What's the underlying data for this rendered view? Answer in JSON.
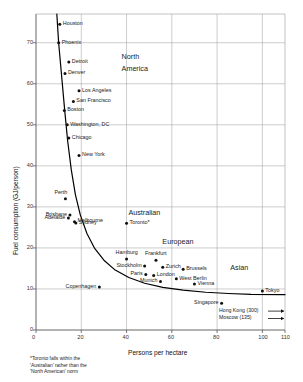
{
  "chart_data": {
    "type": "scatter",
    "title": "",
    "xlabel": "Persons per hectare",
    "ylabel": "Fuel consumption (GJ/person)",
    "xlim": [
      0,
      110
    ],
    "ylim": [
      0,
      77
    ],
    "xticks": [
      0,
      20,
      40,
      60,
      80,
      100,
      110
    ],
    "xtick_labels": [
      "0",
      "20",
      "40",
      "60",
      "80",
      "100",
      "110"
    ],
    "yticks": [
      0,
      10,
      20,
      30,
      40,
      50,
      60,
      70
    ],
    "ytick_labels": [
      "0",
      "10",
      "20",
      "30",
      "40",
      "50",
      "60",
      "70"
    ],
    "grid": true,
    "legend_position": "none",
    "points": [
      {
        "name": "Houston",
        "x": 10.5,
        "y": 74.5,
        "label_side": "right"
      },
      {
        "name": "Phoenix",
        "x": 10.0,
        "y": 70.0,
        "label_side": "right"
      },
      {
        "name": "Detroit",
        "x": 14.5,
        "y": 65.3,
        "label_side": "right"
      },
      {
        "name": "Denver",
        "x": 12.8,
        "y": 62.5,
        "label_side": "right"
      },
      {
        "name": "Los Angeles",
        "x": 19.0,
        "y": 58.3,
        "label_side": "right"
      },
      {
        "name": "San Francisco",
        "x": 16.5,
        "y": 55.7,
        "label_side": "right"
      },
      {
        "name": "Boston",
        "x": 12.5,
        "y": 53.5,
        "label_side": "right"
      },
      {
        "name": "Washington, DC",
        "x": 13.8,
        "y": 50.0,
        "label_side": "right"
      },
      {
        "name": "Chicago",
        "x": 14.5,
        "y": 46.8,
        "label_side": "right"
      },
      {
        "name": "New York",
        "x": 19.0,
        "y": 42.5,
        "label_side": "right"
      },
      {
        "name": "Perth",
        "x": 13.0,
        "y": 32.0,
        "label_side": "above"
      },
      {
        "name": "Brisbane",
        "x": 15.0,
        "y": 28.0,
        "label_side": "left"
      },
      {
        "name": "Adelaide",
        "x": 14.3,
        "y": 27.3,
        "label_side": "left"
      },
      {
        "name": "Melbourne",
        "x": 17.0,
        "y": 26.4,
        "label_side": "right"
      },
      {
        "name": "Sydney",
        "x": 17.6,
        "y": 26.1,
        "label_side": "right"
      },
      {
        "name": "Toronto*",
        "x": 40.0,
        "y": 26.0,
        "label_side": "right"
      },
      {
        "name": "Hamburg",
        "x": 40.0,
        "y": 17.3,
        "label_side": "above"
      },
      {
        "name": "Frankfurt",
        "x": 53.0,
        "y": 17.0,
        "label_side": "above"
      },
      {
        "name": "Stockholm",
        "x": 48.0,
        "y": 15.6,
        "label_side": "left"
      },
      {
        "name": "Zurich",
        "x": 56.0,
        "y": 15.3,
        "label_side": "right"
      },
      {
        "name": "Brussels",
        "x": 65.0,
        "y": 14.8,
        "label_side": "right"
      },
      {
        "name": "Paris",
        "x": 48.5,
        "y": 13.5,
        "label_side": "left"
      },
      {
        "name": "London",
        "x": 52.0,
        "y": 13.3,
        "label_side": "right"
      },
      {
        "name": "West Berlin",
        "x": 62.0,
        "y": 12.5,
        "label_side": "right"
      },
      {
        "name": "Munich",
        "x": 55.0,
        "y": 11.8,
        "label_side": "left"
      },
      {
        "name": "Vienna",
        "x": 70.0,
        "y": 11.2,
        "label_side": "right"
      },
      {
        "name": "Copenhagen",
        "x": 28.0,
        "y": 10.5,
        "label_side": "left"
      },
      {
        "name": "Tokyo",
        "x": 100.0,
        "y": 9.5,
        "label_side": "right"
      },
      {
        "name": "Singapore",
        "x": 82.0,
        "y": 6.5,
        "label_side": "left"
      }
    ],
    "group_labels": [
      {
        "text": "North",
        "x": 44,
        "y": 66.5
      },
      {
        "text": "America",
        "x": 44,
        "y": 63.5
      },
      {
        "text": "Australian",
        "x": 47,
        "y": 28.5
      },
      {
        "text": "European",
        "x": 62,
        "y": 21.5
      },
      {
        "text": "Asian",
        "x": 92,
        "y": 15.0
      }
    ],
    "offscale_annotations": [
      {
        "text": "Hong Kong (300)",
        "value": 300,
        "y": 4.6
      },
      {
        "text": "Moscow (135)",
        "value": 135,
        "y": 2.8
      }
    ],
    "trend_curve": {
      "description": "hyperbolic decay fit",
      "points": [
        [
          9.2,
          77.0
        ],
        [
          10.0,
          70.0
        ],
        [
          11.3,
          62.0
        ],
        [
          12.6,
          54.0
        ],
        [
          14.0,
          46.0
        ],
        [
          15.6,
          39.0
        ],
        [
          17.4,
          33.0
        ],
        [
          19.6,
          28.0
        ],
        [
          22.5,
          23.5
        ],
        [
          26.0,
          19.8
        ],
        [
          30.0,
          17.0
        ],
        [
          35.0,
          14.6
        ],
        [
          41.0,
          12.8
        ],
        [
          48.0,
          11.4
        ],
        [
          56.0,
          10.4
        ],
        [
          65.0,
          9.7
        ],
        [
          75.0,
          9.2
        ],
        [
          85.0,
          8.9
        ],
        [
          95.0,
          8.7
        ],
        [
          110.0,
          8.6
        ]
      ]
    },
    "footnote": "*Toronto falls within the 'Australian' rather than the 'North American' norm"
  },
  "footnote_lines": [
    "*Toronto falls within the",
    "'Australian' rather than the",
    "'North American' norm"
  ],
  "colors": {
    "background": "#ffffff",
    "grid": "#9a9a9a",
    "axis": "#555555",
    "marker": "#111111",
    "curve": "#000000",
    "text": "#1a1a1a"
  }
}
